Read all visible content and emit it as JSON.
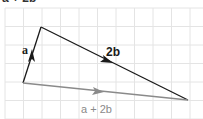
{
  "caption": "a + 2b",
  "grid": {
    "spacing": 18.5,
    "origin_x": 5,
    "origin_y": 8,
    "color": "#e4e4e4"
  },
  "vectors": [
    {
      "name": "a",
      "label": "a",
      "from": [
        23,
        83
      ],
      "to": [
        41,
        27
      ],
      "color": "#1a1a1a",
      "bold": true
    },
    {
      "name": "2b",
      "label": "2b",
      "from": [
        41,
        27
      ],
      "to": [
        188,
        100
      ],
      "color": "#1a1a1a",
      "bold": true
    },
    {
      "name": "a+2b",
      "label": "a + 2b",
      "from": [
        23,
        83
      ],
      "to": [
        188,
        100
      ],
      "color": "#8a8a8a",
      "bold": false
    }
  ],
  "labels": {
    "a": "a",
    "two_b": "2b",
    "sum": "a + 2b"
  }
}
